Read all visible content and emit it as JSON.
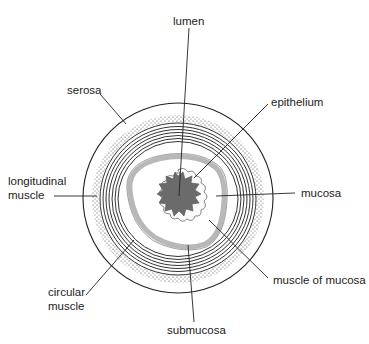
{
  "diagram": {
    "labels": {
      "lumen": "lumen",
      "serosa": "serosa",
      "epithelium": "epithelium",
      "longitudinal_muscle_1": "longitudinal",
      "longitudinal_muscle_2": "muscle",
      "mucosa": "mucosa",
      "circular_muscle_1": "circular",
      "circular_muscle_2": "muscle",
      "muscle_of_mucosa": "muscle of mucosa",
      "submucosa": "submucosa"
    },
    "colors": {
      "line": "#222222",
      "lumen_fill": "#6b6b6b",
      "muscularis_mucosa": "#b5b5b5",
      "stipple": "#333333"
    }
  }
}
